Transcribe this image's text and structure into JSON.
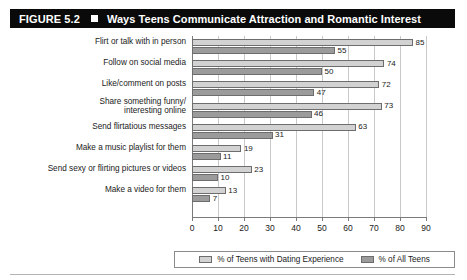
{
  "figure": {
    "number_label": "FIGURE 5.2",
    "separator_icon": "filled-square-icon",
    "title": "Ways Teens Communicate Attraction and Romantic Interest"
  },
  "legend": {
    "series": [
      {
        "label": "% of Teens with Dating Experience",
        "color": "#d2d2d2"
      },
      {
        "label": "% of All Teens",
        "color": "#9b9b9b"
      }
    ]
  },
  "chart_data": {
    "type": "bar",
    "orientation": "horizontal",
    "title": "Ways Teens Communicate Attraction and Romantic Interest",
    "xlabel": "",
    "ylabel": "",
    "xlim": [
      0,
      90
    ],
    "xticks": [
      0,
      10,
      20,
      30,
      40,
      50,
      60,
      70,
      80,
      90
    ],
    "xtick_labels": [
      "0",
      "10",
      "20",
      "30",
      "40",
      "50",
      "60",
      "70",
      "80",
      "90"
    ],
    "grid": true,
    "legend_position": "bottom",
    "categories": [
      "Flirt or talk with in person",
      "Follow on social media",
      "Like/comment on posts",
      "Share something funny/\ninteresting online",
      "Send flirtatious messages",
      "Make a music playlist for them",
      "Send sexy or flirting pictures or videos",
      "Make a video for them"
    ],
    "series": [
      {
        "name": "% of Teens with Dating Experience",
        "color": "#d2d2d2",
        "values": [
          85,
          74,
          72,
          73,
          63,
          19,
          23,
          13
        ]
      },
      {
        "name": "% of All Teens",
        "color": "#9b9b9b",
        "values": [
          55,
          50,
          47,
          46,
          31,
          11,
          10,
          7
        ]
      }
    ]
  }
}
